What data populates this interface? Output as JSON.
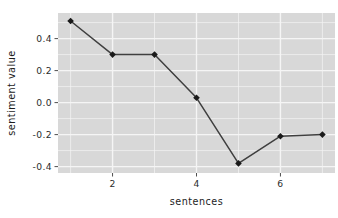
{
  "chart_data": {
    "type": "line",
    "title": "",
    "subtitle": "",
    "xlabel": "sentences",
    "ylabel": "sentiment value",
    "x": [
      1,
      2,
      3,
      4,
      5,
      6,
      7
    ],
    "values": [
      0.51,
      0.3,
      0.3,
      0.03,
      -0.38,
      -0.21,
      -0.2
    ],
    "series": [
      {
        "name": "sentiment value",
        "values": [
          0.51,
          0.3,
          0.3,
          0.03,
          -0.38,
          -0.21,
          -0.2
        ]
      }
    ],
    "xlim": [
      0.7,
      7.3
    ],
    "ylim": [
      -0.44,
      0.56
    ],
    "xticks": [
      2,
      4,
      6
    ],
    "xtick_labels": [
      "2",
      "4",
      "6"
    ],
    "yticks": [
      0.4,
      0.2,
      0.0,
      -0.2,
      -0.4
    ],
    "ytick_labels": [
      "0.4",
      "0.2",
      "0.0",
      "-0.2",
      "-0.4"
    ],
    "grid": true,
    "legend": "none",
    "marker": "filled-diamond",
    "line_color": "#3f3f3f",
    "marker_color": "#1a1a1a",
    "panel_background": "#d8d8d8",
    "gridline_color": "#f5f5f5",
    "plot_background": "#ffffff"
  },
  "axes": {
    "x_title": "sentences",
    "y_title": "sentiment value"
  }
}
